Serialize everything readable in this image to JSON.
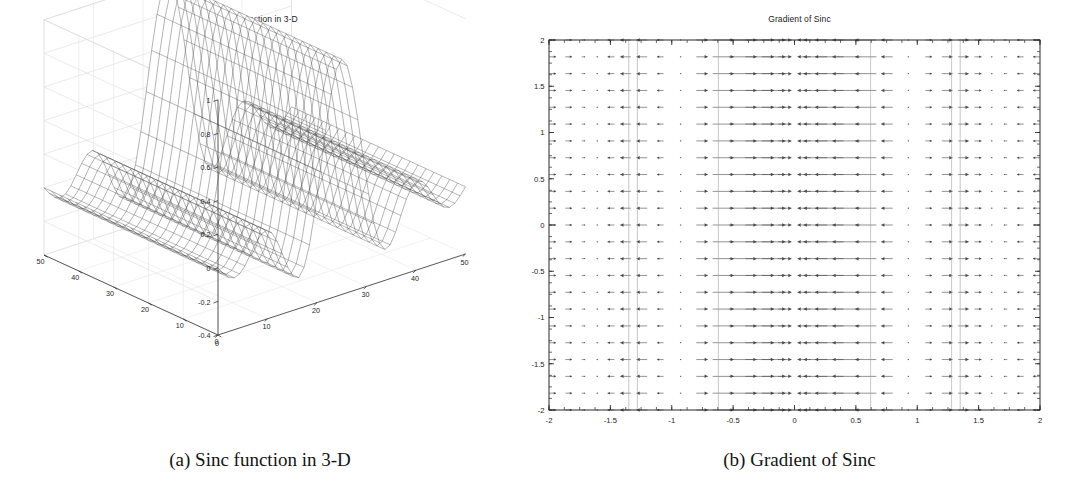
{
  "figure": {
    "subfigures": [
      {
        "label": "(a)",
        "caption": "(a) Sinc function in 3-D",
        "panel_title": "Sinc function in 3-D"
      },
      {
        "label": "(b)",
        "caption": "(b) Gradient of Sinc",
        "panel_title": "Gradient of Sinc"
      }
    ]
  },
  "chart_data": [
    {
      "type": "surface",
      "title": "Sinc function in 3-D",
      "render": "wireframe-mesh",
      "xlabel": "",
      "ylabel": "",
      "zlabel": "",
      "xlim": [
        0,
        50
      ],
      "ylim": [
        0,
        50
      ],
      "zlim": [
        -0.4,
        1
      ],
      "xticks": [
        0,
        10,
        20,
        30,
        40,
        50
      ],
      "yticks": [
        0,
        10,
        20,
        30,
        40,
        50
      ],
      "zticks": [
        -0.4,
        -0.2,
        0,
        0.2,
        0.4,
        0.6,
        0.8,
        1
      ],
      "xtick_labels": [
        "0",
        "10",
        "20",
        "30",
        "40",
        "50"
      ],
      "ytick_labels": [
        "0",
        "10",
        "20",
        "30",
        "40",
        "50"
      ],
      "ztick_labels": [
        "-0.4",
        "-0.2",
        "0",
        "0.2",
        "0.4",
        "0.6",
        "0.8",
        "1"
      ],
      "grid": true,
      "legend": null,
      "description": "Mesh surface of a 1-D sinc profile extruded along the y direction: z = sinc(x) ridge, peak 1 at the centre, negative side-lobe near -0.22, flat tails.",
      "profile_x": [
        0,
        2,
        4,
        6,
        8,
        10,
        12,
        14,
        16,
        18,
        20,
        22,
        24,
        25,
        26,
        28,
        30,
        32,
        34,
        36,
        38,
        40,
        42,
        44,
        46,
        48,
        50
      ],
      "profile_z": [
        -0.04,
        -0.05,
        -0.04,
        0.0,
        0.05,
        0.02,
        -0.08,
        -0.21,
        -0.18,
        0.06,
        0.42,
        0.77,
        0.97,
        1.0,
        0.97,
        0.77,
        0.42,
        0.06,
        -0.18,
        -0.21,
        -0.08,
        0.02,
        0.05,
        0.0,
        -0.04,
        -0.05,
        -0.04
      ]
    },
    {
      "type": "quiver",
      "title": "Gradient of Sinc",
      "xlabel": "",
      "ylabel": "",
      "xlim": [
        -2,
        2
      ],
      "ylim": [
        -2,
        2
      ],
      "xticks": [
        -2,
        -1.5,
        -1,
        -0.5,
        0,
        0.5,
        1,
        1.5,
        2
      ],
      "yticks": [
        -2,
        -1.5,
        -1,
        -0.5,
        0,
        0.5,
        1,
        1.5,
        2
      ],
      "xtick_labels": [
        "-2",
        "-1.5",
        "-1",
        "-0.5",
        "0",
        "0.5",
        "1",
        "1.5",
        "2"
      ],
      "ytick_labels": [
        "-2",
        "-1.5",
        "-1",
        "-0.5",
        "0",
        "0.5",
        "1",
        "1.5",
        "2"
      ],
      "grid": false,
      "legend": null,
      "description": "Vector field of the gradient of the sinc ridge. All arrows are horizontal (v component = 0); the u component depends only on x and is identical for every row of y. Arrows point toward x = 0 from both sides with magnitude peaking near x = +/-0.6 and vanishing at x = 0 and at the side-lobe extrema.",
      "arrow_grid_nx": 31,
      "arrow_grid_ny": 23,
      "u_profile_x": [
        -2.0,
        -1.87,
        -1.73,
        -1.6,
        -1.47,
        -1.33,
        -1.2,
        -1.07,
        -0.93,
        -0.8,
        -0.67,
        -0.53,
        -0.4,
        -0.27,
        -0.13,
        0.0,
        0.13,
        0.27,
        0.4,
        0.53,
        0.67,
        0.8,
        0.93,
        1.07,
        1.2,
        1.33,
        1.47,
        1.6,
        1.73,
        1.87,
        2.0
      ],
      "u_profile_u": [
        0.1,
        0.16,
        0.12,
        0.02,
        -0.06,
        -0.02,
        0.18,
        0.42,
        0.62,
        0.82,
        0.96,
        0.9,
        0.72,
        0.48,
        0.24,
        0.0,
        -0.24,
        -0.48,
        -0.72,
        -0.9,
        -0.96,
        -0.82,
        -0.62,
        -0.42,
        -0.18,
        0.02,
        0.06,
        -0.02,
        -0.12,
        -0.16,
        -0.1
      ],
      "v_profile_v": 0.0
    }
  ]
}
